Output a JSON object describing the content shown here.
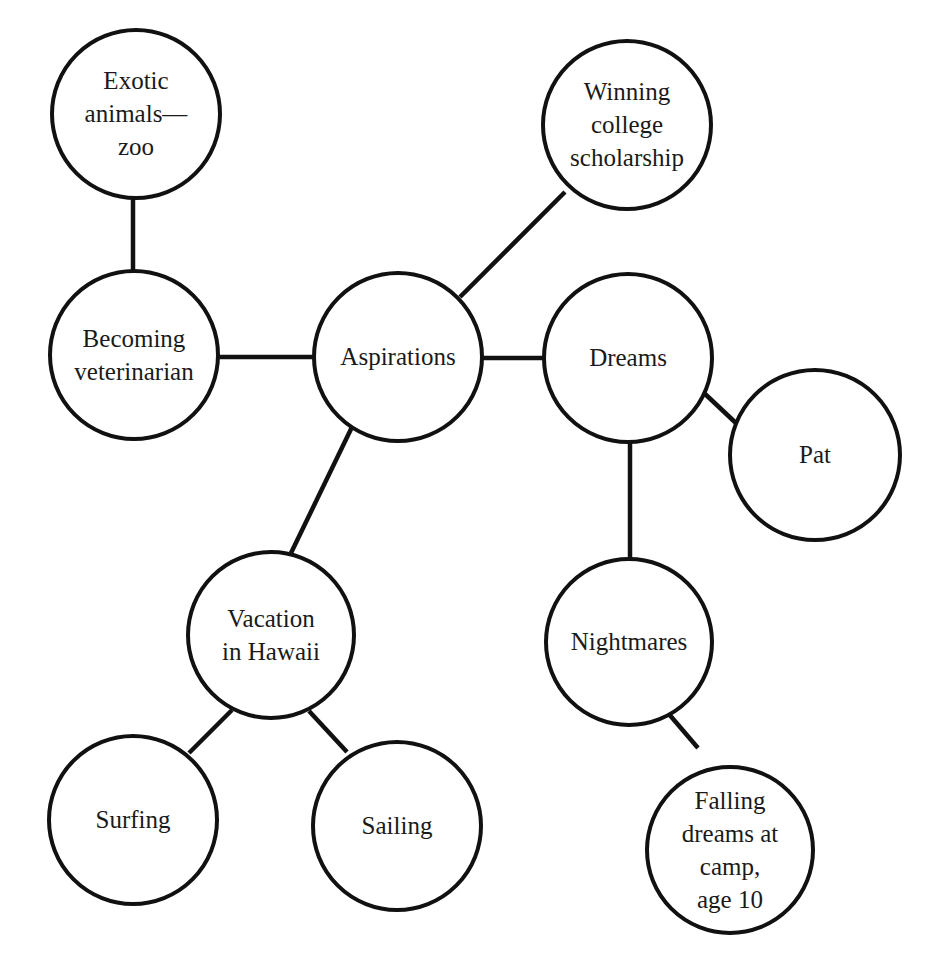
{
  "diagram": {
    "type": "cluster-map",
    "center_node": "aspirations",
    "colors": {
      "stroke": "#111111",
      "text": "#1a1a1a",
      "background": "#ffffff"
    },
    "nodes": [
      {
        "id": "exotic",
        "cx": 136,
        "cy": 114,
        "r": 84,
        "lines": [
          "Exotic",
          "animals—",
          "zoo"
        ]
      },
      {
        "id": "veterinarian",
        "cx": 134,
        "cy": 355,
        "r": 84,
        "lines": [
          "Becoming",
          "veterinarian"
        ]
      },
      {
        "id": "aspirations",
        "cx": 398,
        "cy": 357,
        "r": 84,
        "lines": [
          "Aspirations"
        ]
      },
      {
        "id": "scholarship",
        "cx": 627,
        "cy": 125,
        "r": 84,
        "lines": [
          "Winning",
          "college",
          "scholarship"
        ]
      },
      {
        "id": "dreams",
        "cx": 628,
        "cy": 358,
        "r": 84,
        "lines": [
          "Dreams"
        ]
      },
      {
        "id": "pat",
        "cx": 815,
        "cy": 455,
        "r": 85,
        "lines": [
          "Pat"
        ]
      },
      {
        "id": "hawaii",
        "cx": 271,
        "cy": 635,
        "r": 83,
        "lines": [
          "Vacation",
          "in Hawaii"
        ]
      },
      {
        "id": "surfing",
        "cx": 133,
        "cy": 820,
        "r": 84,
        "lines": [
          "Surfing"
        ]
      },
      {
        "id": "sailing",
        "cx": 397,
        "cy": 826,
        "r": 84,
        "lines": [
          "Sailing"
        ]
      },
      {
        "id": "nightmares",
        "cx": 629,
        "cy": 642,
        "r": 83,
        "lines": [
          "Nightmares"
        ]
      },
      {
        "id": "falling",
        "cx": 730,
        "cy": 850,
        "r": 83,
        "lines": [
          "Falling",
          "dreams at",
          "camp,",
          "age 10"
        ]
      }
    ],
    "edges": [
      {
        "from": "exotic",
        "to": "veterinarian",
        "x1": 133,
        "y1": 198,
        "x2": 133,
        "y2": 271
      },
      {
        "from": "veterinarian",
        "to": "aspirations",
        "x1": 218,
        "y1": 357,
        "x2": 316,
        "y2": 357
      },
      {
        "from": "aspirations",
        "to": "scholarship",
        "x1": 460,
        "y1": 297,
        "x2": 565,
        "y2": 192
      },
      {
        "from": "aspirations",
        "to": "dreams",
        "x1": 482,
        "y1": 358,
        "x2": 544,
        "y2": 358
      },
      {
        "from": "aspirations",
        "to": "hawaii",
        "x1": 352,
        "y1": 427,
        "x2": 291,
        "y2": 553
      },
      {
        "from": "dreams",
        "to": "pat",
        "x1": 704,
        "y1": 393,
        "x2": 737,
        "y2": 424
      },
      {
        "from": "dreams",
        "to": "nightmares",
        "x1": 630,
        "y1": 442,
        "x2": 630,
        "y2": 559
      },
      {
        "from": "hawaii",
        "to": "surfing",
        "x1": 232,
        "y1": 710,
        "x2": 189,
        "y2": 753
      },
      {
        "from": "hawaii",
        "to": "sailing",
        "x1": 309,
        "y1": 711,
        "x2": 347,
        "y2": 752
      },
      {
        "from": "nightmares",
        "to": "falling",
        "x1": 668,
        "y1": 713,
        "x2": 698,
        "y2": 748
      }
    ]
  }
}
